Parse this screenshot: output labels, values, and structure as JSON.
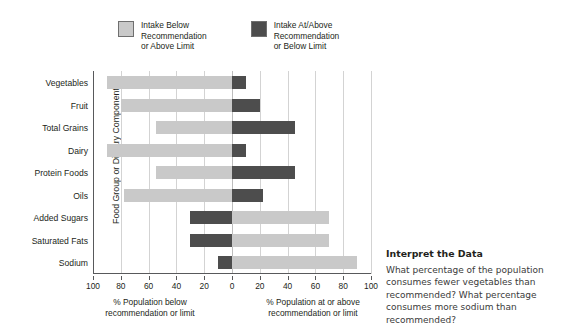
{
  "legend": {
    "items": [
      {
        "name": "intake-below",
        "label": "Intake Below\nRecommendation\nor Above Limit",
        "color": "#c9c9c9"
      },
      {
        "name": "intake-at-above",
        "label": "Intake At/Above\nRecommendation\nor Below Limit",
        "color": "#4d4d4d"
      }
    ]
  },
  "axes": {
    "ylabel": "Food Group or Diarary Component",
    "xlabel_left": "% Population below\nrecommendation or limit",
    "xlabel_right": "% Population at or above\nrecommendation or limit",
    "ticks": [
      "100",
      "80",
      "60",
      "40",
      "20",
      "0",
      "20",
      "40",
      "60",
      "80",
      "100"
    ]
  },
  "interpret": {
    "title": "Interpret the Data",
    "body": "What percentage of the population consumes fewer vegetables than recommended? What percentage consumes more sodium than recommended?"
  },
  "chart_data": {
    "type": "bar",
    "orientation": "horizontal-diverging",
    "title": "",
    "xlabel": "% Population below recommendation or limit | % Population at or above recommendation or limit",
    "ylabel": "Food Group or Diarary Component",
    "categories": [
      "Vegetables",
      "Fruit",
      "Total Grains",
      "Dairy",
      "Protein Foods",
      "Oils",
      "Added Sugars",
      "Saturated Fats",
      "Sodium"
    ],
    "series": [
      {
        "name": "Intake Below Recommendation or Above Limit",
        "color": "#c9c9c9",
        "values": [
          90,
          80,
          55,
          90,
          55,
          78,
          70,
          70,
          90
        ]
      },
      {
        "name": "Intake At/Above Recommendation or Below Limit",
        "color": "#4d4d4d",
        "values": [
          10,
          20,
          45,
          10,
          45,
          22,
          30,
          30,
          10
        ]
      }
    ],
    "rows": [
      {
        "category": "Vegetables",
        "left_value": 90,
        "right_value": 10,
        "left_color": "#c9c9c9",
        "right_color": "#4d4d4d"
      },
      {
        "category": "Fruit",
        "left_value": 80,
        "right_value": 20,
        "left_color": "#c9c9c9",
        "right_color": "#4d4d4d"
      },
      {
        "category": "Total Grains",
        "left_value": 55,
        "right_value": 45,
        "left_color": "#c9c9c9",
        "right_color": "#4d4d4d"
      },
      {
        "category": "Dairy",
        "left_value": 90,
        "right_value": 10,
        "left_color": "#c9c9c9",
        "right_color": "#4d4d4d"
      },
      {
        "category": "Protein Foods",
        "left_value": 55,
        "right_value": 45,
        "left_color": "#c9c9c9",
        "right_color": "#4d4d4d"
      },
      {
        "category": "Oils",
        "left_value": 78,
        "right_value": 22,
        "left_color": "#c9c9c9",
        "right_color": "#4d4d4d"
      },
      {
        "category": "Added Sugars",
        "left_value": 30,
        "right_value": 70,
        "left_color": "#4d4d4d",
        "right_color": "#c9c9c9"
      },
      {
        "category": "Saturated Fats",
        "left_value": 30,
        "right_value": 70,
        "left_color": "#4d4d4d",
        "right_color": "#c9c9c9"
      },
      {
        "category": "Sodium",
        "left_value": 10,
        "right_value": 90,
        "left_color": "#4d4d4d",
        "right_color": "#c9c9c9"
      }
    ],
    "xlim": [
      -100,
      100
    ],
    "grid": true,
    "legend_position": "top"
  }
}
